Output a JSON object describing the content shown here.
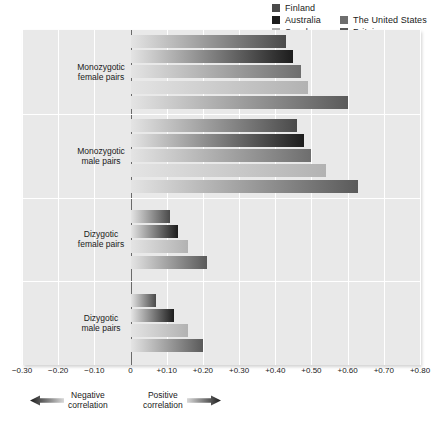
{
  "legend": {
    "entries": [
      {
        "label": "Finland",
        "color": "#4a4a4a"
      },
      {
        "label": "Australia",
        "color": "#1c1c1c"
      },
      {
        "label": "The United States",
        "color": "#6e6e6e"
      },
      {
        "label": "Sweden",
        "color": "#b2b2b2"
      },
      {
        "label": "Britain",
        "color": "#5a5a5a"
      }
    ]
  },
  "footnote": {
    "negative": {
      "line1": "Negative",
      "line2": "correlation",
      "icon": "left-arrow-icon"
    },
    "positive": {
      "line1": "Positive",
      "line2": "correlation",
      "icon": "right-arrow-icon"
    }
  },
  "chart_data": {
    "type": "bar",
    "orientation": "horizontal",
    "title": "",
    "xlabel": "",
    "ylabel": "",
    "xlim": [
      -0.3,
      0.8
    ],
    "xticks": [
      -0.3,
      -0.2,
      -0.1,
      0,
      0.1,
      0.2,
      0.3,
      0.4,
      0.5,
      0.6,
      0.7,
      0.8
    ],
    "xtick_labels": [
      "−0.30",
      "−0.20",
      "−0.10",
      "0",
      "+0.10",
      "+0.20",
      "+0.30",
      "+0.40",
      "+0.50",
      "+0.60",
      "+0.70",
      "+0.80"
    ],
    "grid": true,
    "legend_position": "top-right",
    "categories": [
      "Monozygotic female pairs",
      "Monozygotic male pairs",
      "Dizygotic female pairs",
      "Dizygotic male pairs"
    ],
    "category_lines": [
      [
        "Monozygotic",
        "female pairs"
      ],
      [
        "Monozygotic",
        "male pairs"
      ],
      [
        "Dizygotic",
        "female pairs"
      ],
      [
        "Dizygotic",
        "male pairs"
      ]
    ],
    "series": [
      {
        "name": "Finland",
        "color": "#4a4a4a",
        "values": [
          0.43,
          0.46,
          0.11,
          0.07
        ]
      },
      {
        "name": "Australia",
        "color": "#1c1c1c",
        "values": [
          0.45,
          0.48,
          0.13,
          0.12
        ]
      },
      {
        "name": "The United States",
        "color": "#6e6e6e",
        "values": [
          0.47,
          0.5,
          null,
          null
        ]
      },
      {
        "name": "Sweden",
        "color": "#b2b2b2",
        "values": [
          0.49,
          0.54,
          0.16,
          0.16
        ]
      },
      {
        "name": "Britain",
        "color": "#5a5a5a",
        "values": [
          0.6,
          0.63,
          0.21,
          0.2
        ]
      }
    ]
  }
}
